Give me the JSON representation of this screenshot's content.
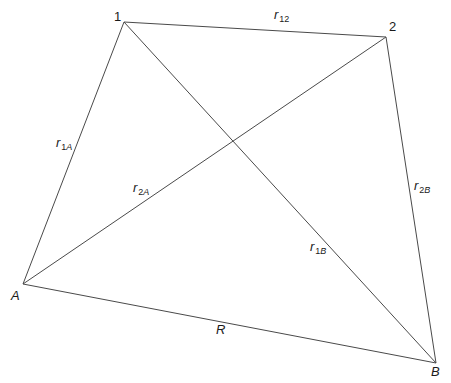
{
  "diagram": {
    "stroke_color": "#4a4a4a",
    "vertices": [
      {
        "id": "1",
        "label": "1",
        "x": 124,
        "y": 22
      },
      {
        "id": "2",
        "label": "2",
        "x": 386,
        "y": 37
      },
      {
        "id": "A",
        "label": "A",
        "x": 23,
        "y": 284
      },
      {
        "id": "B",
        "label": "B",
        "x": 436,
        "y": 363
      }
    ],
    "edges": [
      {
        "from": "1",
        "to": "2",
        "symbol": "r",
        "subscript": "12"
      },
      {
        "from": "1",
        "to": "A",
        "symbol": "r",
        "subscript_num": "1",
        "subscript_letter": "A"
      },
      {
        "from": "2",
        "to": "A",
        "symbol": "r",
        "subscript_num": "2",
        "subscript_letter": "A"
      },
      {
        "from": "2",
        "to": "B",
        "symbol": "r",
        "subscript_num": "2",
        "subscript_letter": "B"
      },
      {
        "from": "1",
        "to": "B",
        "symbol": "r",
        "subscript_num": "1",
        "subscript_letter": "B"
      },
      {
        "from": "A",
        "to": "B",
        "symbol": "R"
      }
    ],
    "labels": {
      "v1": "1",
      "v2": "2",
      "vA": "A",
      "vB": "B",
      "r12": {
        "sym": "r",
        "sub": "12"
      },
      "r1A": {
        "sym": "r",
        "sub_num": "1",
        "sub_letter": "A"
      },
      "r2A": {
        "sym": "r",
        "sub_num": "2",
        "sub_letter": "A"
      },
      "r2B": {
        "sym": "r",
        "sub_num": "2",
        "sub_letter": "B"
      },
      "r1B": {
        "sym": "r",
        "sub_num": "1",
        "sub_letter": "B"
      },
      "R": {
        "sym": "R"
      }
    }
  }
}
